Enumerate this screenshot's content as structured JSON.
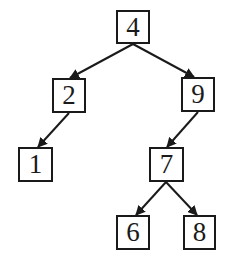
{
  "diagram": {
    "type": "binary-search-tree",
    "colors": {
      "stroke": "#1a1a1a",
      "background": "#ffffff"
    },
    "nodes": [
      {
        "id": "n4",
        "label": "4",
        "x": 116,
        "y": 10,
        "w": 34,
        "h": 34
      },
      {
        "id": "n2",
        "label": "2",
        "x": 52,
        "y": 78,
        "w": 34,
        "h": 35
      },
      {
        "id": "n9",
        "label": "9",
        "x": 181,
        "y": 77,
        "w": 34,
        "h": 35
      },
      {
        "id": "n1",
        "label": "1",
        "x": 18,
        "y": 147,
        "w": 35,
        "h": 35
      },
      {
        "id": "n7",
        "label": "7",
        "x": 149,
        "y": 147,
        "w": 35,
        "h": 35
      },
      {
        "id": "n6",
        "label": "6",
        "x": 116,
        "y": 215,
        "w": 34,
        "h": 35
      },
      {
        "id": "n8",
        "label": "8",
        "x": 183,
        "y": 215,
        "w": 33,
        "h": 35
      }
    ],
    "edges": [
      {
        "from": "4",
        "to": "2"
      },
      {
        "from": "4",
        "to": "9"
      },
      {
        "from": "2",
        "to": "1"
      },
      {
        "from": "9",
        "to": "7"
      },
      {
        "from": "7",
        "to": "6"
      },
      {
        "from": "7",
        "to": "8"
      }
    ]
  }
}
